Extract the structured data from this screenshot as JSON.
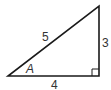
{
  "diagram": {
    "type": "right-triangle",
    "stroke_color": "#1a1a1a",
    "label_color": "#333333",
    "vertices": {
      "bottom_left": [
        8,
        76
      ],
      "bottom_right": [
        99,
        76
      ],
      "top": [
        99,
        6
      ]
    },
    "labels": {
      "hypotenuse": "5",
      "opposite": "3",
      "adjacent": "4",
      "angle": "A"
    },
    "right_angle_marker": "bottom-right"
  }
}
